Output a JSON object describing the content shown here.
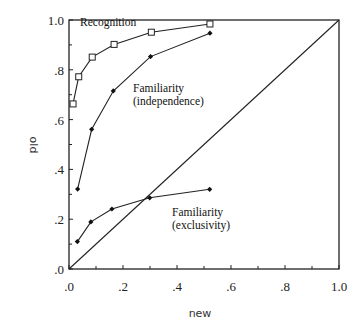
{
  "chart_data": {
    "type": "line",
    "title": "",
    "xlabel": "new",
    "ylabel": "old",
    "xlim": [
      0,
      1.0
    ],
    "ylim": [
      0,
      1.0
    ],
    "grid": false,
    "legend_position": "inline annotations",
    "x_ticks": [
      ".0",
      ".2",
      ".4",
      ".6",
      ".8",
      "1.0"
    ],
    "y_ticks": [
      ".0",
      ".2",
      ".4",
      ".6",
      ".8",
      "1.0"
    ],
    "reference_line": {
      "name": "chance diagonal",
      "from": [
        0,
        0
      ],
      "to": [
        1,
        1
      ]
    },
    "series": [
      {
        "name": "Recognition",
        "marker": "open-square",
        "x": [
          0.015,
          0.036,
          0.086,
          0.167,
          0.305,
          0.522
        ],
        "y": [
          0.663,
          0.772,
          0.851,
          0.902,
          0.951,
          0.984
        ]
      },
      {
        "name": "Familiarity (independence)",
        "marker": "filled-diamond",
        "x": [
          0.032,
          0.084,
          0.164,
          0.302,
          0.522
        ],
        "y": [
          0.321,
          0.561,
          0.715,
          0.853,
          0.947
        ]
      },
      {
        "name": "Familiarity (exclusivity)",
        "marker": "filled-diamond",
        "x": [
          0.031,
          0.081,
          0.159,
          0.299,
          0.521
        ],
        "y": [
          0.11,
          0.189,
          0.241,
          0.286,
          0.32
        ]
      }
    ],
    "annotations": [
      {
        "lines": [
          "Recognition"
        ],
        "x": 80,
        "y": 26
      },
      {
        "lines": [
          "Familiarity",
          "(independence)"
        ],
        "x": 133,
        "y": 92
      },
      {
        "lines": [
          "Familiarity",
          "(exclusivity)"
        ],
        "x": 172,
        "y": 216
      }
    ]
  }
}
